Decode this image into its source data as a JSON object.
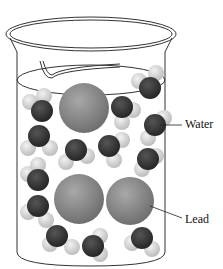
{
  "diagram": {
    "labels": {
      "water": "Water",
      "lead": "Lead"
    },
    "colors": {
      "lead": "#8a8a8a",
      "oxygen": "#3a3a3a",
      "hydrogen": "#d8d8d8",
      "outline": "#222222"
    }
  }
}
